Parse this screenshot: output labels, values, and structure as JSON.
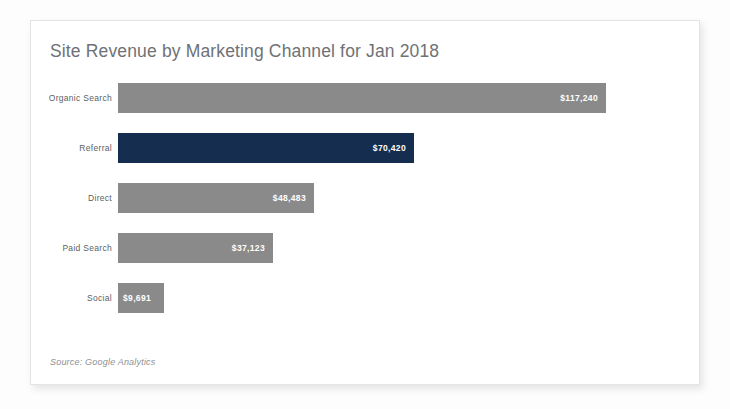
{
  "card": {
    "title": "Site Revenue by Marketing Channel for Jan 2018",
    "source_note": "Source: Google Analytics"
  },
  "colors": {
    "bar_default": "#8a8a8a",
    "bar_highlight": "#152d4e",
    "title_text": "#6e7276",
    "label_text": "#5b5f63",
    "value_text": "#ffffff",
    "card_background": "#ffffff",
    "card_border": "#e3e4e6"
  },
  "chart_data": {
    "type": "bar",
    "orientation": "horizontal",
    "title": "Site Revenue by Marketing Channel for Jan 2018",
    "xlabel": "",
    "ylabel": "",
    "grid": false,
    "legend": "none",
    "axis_visible": false,
    "xlim": [
      0,
      117240
    ],
    "categories": [
      "Organic Search",
      "Referral",
      "Direct",
      "Paid Search",
      "Social"
    ],
    "values": [
      117240,
      70420,
      48483,
      37123,
      9691
    ],
    "value_labels": [
      "$117,240",
      "$70,420",
      "$48,483",
      "$37,123",
      "$9,691"
    ],
    "highlight_category": "Referral",
    "bars": [
      {
        "category": "Organic Search",
        "value": 117240,
        "label": "$117,240",
        "width_px": 488,
        "highlighted": false,
        "label_inside_right": true
      },
      {
        "category": "Referral",
        "value": 70420,
        "label": "$70,420",
        "width_px": 296,
        "highlighted": true,
        "label_inside_right": true
      },
      {
        "category": "Direct",
        "value": 48483,
        "label": "$48,483",
        "width_px": 196,
        "highlighted": false,
        "label_inside_right": true
      },
      {
        "category": "Paid Search",
        "value": 37123,
        "label": "$37,123",
        "width_px": 155,
        "highlighted": false,
        "label_inside_right": true
      },
      {
        "category": "Social",
        "value": 9691,
        "label": "$9,691",
        "width_px": 46,
        "highlighted": false,
        "label_inside_right": false
      }
    ]
  }
}
